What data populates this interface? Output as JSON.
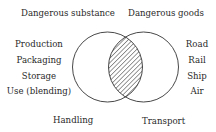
{
  "diagram": {
    "type": "venn",
    "sets": {
      "left": {
        "title": "Dangerous substance",
        "scope_label": "Handling",
        "items": [
          "Production",
          "Packaging",
          "Storage",
          "Use (blending)"
        ]
      },
      "right": {
        "title": "Dangerous goods",
        "scope_label": "Transport",
        "items": [
          "Road",
          "Rail",
          "Ship",
          "Air"
        ]
      }
    },
    "intersection": {
      "fill": "hatched"
    },
    "colors": {
      "stroke": "#333333",
      "background": "#ffffff"
    }
  }
}
